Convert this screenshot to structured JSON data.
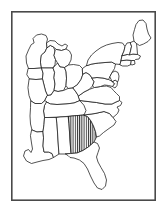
{
  "figure": {
    "title": "Eastern United States Outline Map",
    "type": "outline-map",
    "region": "Eastern United States",
    "background_color": "#ffffff",
    "outline_color": "#1a1a1a",
    "frame_color": "#4a4a4a",
    "highlight_fill": "vertical-hatch",
    "highlight_color": "#1a1a1a"
  },
  "frame": {
    "x": 11,
    "y": 11,
    "width": 145,
    "height": 190,
    "stroke_width": 1.6
  },
  "highlight": {
    "state": "Georgia",
    "pattern": "vertical-hatch",
    "line_count": 8,
    "bounds": {
      "x": 68,
      "y": 128,
      "width": 17,
      "height": 18
    }
  },
  "states": [
    {
      "id": "minnesota",
      "name": "Minnesota",
      "abbr": "MN",
      "highlighted": false
    },
    {
      "id": "wisconsin",
      "name": "Wisconsin",
      "abbr": "WI",
      "highlighted": false
    },
    {
      "id": "michigan-upper",
      "name": "Michigan Upper Peninsula",
      "abbr": "MI",
      "highlighted": false
    },
    {
      "id": "michigan-lower",
      "name": "Michigan Lower Peninsula",
      "abbr": "MI",
      "highlighted": false
    },
    {
      "id": "iowa",
      "name": "Iowa",
      "abbr": "IA",
      "highlighted": false
    },
    {
      "id": "illinois",
      "name": "Illinois",
      "abbr": "IL",
      "highlighted": false
    },
    {
      "id": "indiana",
      "name": "Indiana",
      "abbr": "IN",
      "highlighted": false
    },
    {
      "id": "ohio",
      "name": "Ohio",
      "abbr": "OH",
      "highlighted": false
    },
    {
      "id": "missouri",
      "name": "Missouri",
      "abbr": "MO",
      "highlighted": false
    },
    {
      "id": "kentucky",
      "name": "Kentucky",
      "abbr": "KY",
      "highlighted": false
    },
    {
      "id": "tennessee",
      "name": "Tennessee",
      "abbr": "TN",
      "highlighted": false
    },
    {
      "id": "arkansas",
      "name": "Arkansas",
      "abbr": "AR",
      "highlighted": false
    },
    {
      "id": "louisiana",
      "name": "Louisiana",
      "abbr": "LA",
      "highlighted": false
    },
    {
      "id": "mississippi",
      "name": "Mississippi",
      "abbr": "MS",
      "highlighted": false
    },
    {
      "id": "alabama",
      "name": "Alabama",
      "abbr": "AL",
      "highlighted": false
    },
    {
      "id": "georgia",
      "name": "Georgia",
      "abbr": "GA",
      "highlighted": true
    },
    {
      "id": "florida",
      "name": "Florida",
      "abbr": "FL",
      "highlighted": false
    },
    {
      "id": "south-carolina",
      "name": "South Carolina",
      "abbr": "SC",
      "highlighted": false
    },
    {
      "id": "north-carolina",
      "name": "North Carolina",
      "abbr": "NC",
      "highlighted": false
    },
    {
      "id": "virginia",
      "name": "Virginia",
      "abbr": "VA",
      "highlighted": false
    },
    {
      "id": "west-virginia",
      "name": "West Virginia",
      "abbr": "WV",
      "highlighted": false
    },
    {
      "id": "maryland",
      "name": "Maryland",
      "abbr": "MD",
      "highlighted": false
    },
    {
      "id": "delaware",
      "name": "Delaware",
      "abbr": "DE",
      "highlighted": false
    },
    {
      "id": "pennsylvania",
      "name": "Pennsylvania",
      "abbr": "PA",
      "highlighted": false
    },
    {
      "id": "new-jersey",
      "name": "New Jersey",
      "abbr": "NJ",
      "highlighted": false
    },
    {
      "id": "new-york",
      "name": "New York",
      "abbr": "NY",
      "highlighted": false
    },
    {
      "id": "connecticut",
      "name": "Connecticut",
      "abbr": "CT",
      "highlighted": false
    },
    {
      "id": "rhode-island",
      "name": "Rhode Island",
      "abbr": "RI",
      "highlighted": false
    },
    {
      "id": "massachusetts",
      "name": "Massachusetts",
      "abbr": "MA",
      "highlighted": false
    },
    {
      "id": "vermont",
      "name": "Vermont",
      "abbr": "VT",
      "highlighted": false
    },
    {
      "id": "new-hampshire",
      "name": "New Hampshire",
      "abbr": "NH",
      "highlighted": false
    },
    {
      "id": "maine",
      "name": "Maine",
      "abbr": "ME",
      "highlighted": false
    }
  ]
}
